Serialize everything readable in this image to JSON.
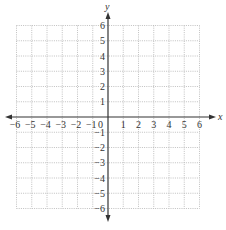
{
  "chart_data": {
    "type": "coordinate-grid",
    "title": "",
    "xlabel": "x",
    "ylabel": "y",
    "xlim": [
      -6,
      6
    ],
    "ylim": [
      -6,
      6
    ],
    "grid": true,
    "grid_style": "dotted",
    "x_ticks": [
      -6,
      -5,
      -4,
      -3,
      -2,
      -1,
      1,
      2,
      3,
      4,
      5,
      6
    ],
    "y_ticks": [
      6,
      5,
      4,
      3,
      2,
      1,
      -1,
      -2,
      -3,
      -4,
      -5,
      -6
    ],
    "x_tick_labels": [
      "−6",
      "−5",
      "−4",
      "−3",
      "−2",
      "−1",
      "1",
      "2",
      "3",
      "4",
      "5",
      "6"
    ],
    "y_tick_labels": [
      "6",
      "5",
      "4",
      "3",
      "2",
      "1",
      "−1",
      "−2",
      "−3",
      "−4",
      "−5",
      "−6"
    ],
    "origin_label": "0",
    "series": []
  },
  "colors": {
    "axis": "#333333",
    "grid": "#b0b0b0",
    "background": "#ffffff"
  }
}
